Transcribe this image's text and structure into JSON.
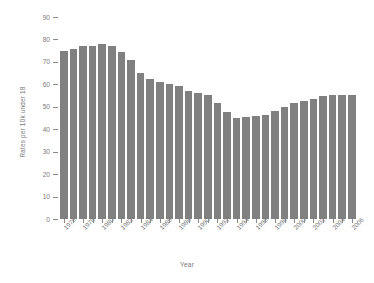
{
  "chart_data": {
    "type": "bar",
    "title": "",
    "xlabel": "Year",
    "ylabel": "Rates per 10k under 18",
    "ylim": [
      0,
      90
    ],
    "ytick_values": [
      0,
      10,
      20,
      30,
      40,
      50,
      60,
      70,
      80,
      90
    ],
    "ytick_labels": [
      "0",
      "10",
      "20",
      "30",
      "40",
      "50",
      "60",
      "70",
      "80",
      "90"
    ],
    "grid": false,
    "legend": null,
    "bar_color": "#808080",
    "background_color": "#ffffff",
    "text_color": "#7a7a7a",
    "categories": [
      "1976",
      "1977",
      "1978",
      "1979",
      "1980",
      "1981",
      "1982",
      "1983",
      "1984",
      "1985",
      "1986",
      "1987",
      "1988",
      "1989",
      "1990",
      "1991",
      "1992",
      "1993",
      "1994",
      "1995",
      "1996",
      "1997",
      "1998",
      "1999",
      "2000",
      "2001",
      "2002",
      "2003",
      "2004",
      "2005",
      "2006"
    ],
    "values": [
      75.0,
      75.8,
      77.2,
      77.2,
      78.0,
      77.0,
      74.5,
      71.0,
      65.0,
      62.2,
      61.0,
      60.2,
      59.4,
      57.2,
      56.2,
      55.2,
      51.5,
      47.6,
      45.2,
      45.6,
      46.0,
      46.3,
      48.0,
      49.8,
      51.8,
      52.5,
      53.4,
      54.6,
      55.2,
      55.2,
      55.2
    ],
    "xtick_labels_shown": [
      "1976",
      "1978",
      "1980",
      "1982",
      "1984",
      "1986",
      "1988",
      "1990",
      "1992",
      "1994",
      "1996",
      "1998",
      "2000",
      "2002",
      "2004",
      "2006"
    ]
  }
}
